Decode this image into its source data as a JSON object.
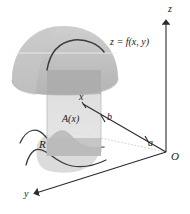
{
  "figure": {
    "background_color": "#ffffff",
    "line_color": "#2b2b2b",
    "labels": {
      "z_axis": "z",
      "y_axis": "y",
      "x_tick": "x",
      "origin": "O",
      "param_a": "a",
      "param_b": "b",
      "cross_section_area": "A(x)",
      "region": "R",
      "surface": "z = f(x, y)"
    },
    "colors": {
      "surface_fill": "#c3c3c3",
      "surface_fill_light": "#d0d0d0",
      "slab_fill": "#dcdcdc",
      "slab_fill_dark": "#c8c8c8",
      "base_region_fill": "#c9c9c9",
      "curve_dark": "#3a3a3a",
      "axis": "#2b2b2b"
    }
  }
}
